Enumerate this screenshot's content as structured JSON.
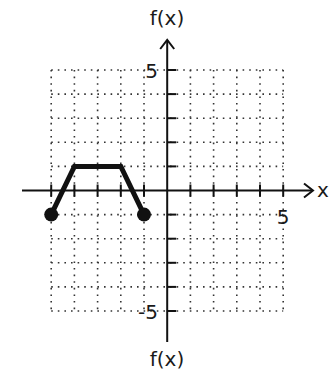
{
  "chart_data": {
    "type": "line",
    "title": "",
    "xlabel": "x",
    "ylabel": "f(x)",
    "ylabel_bottom": "f(x)",
    "xlim": [
      -5,
      5
    ],
    "ylim": [
      -5,
      5
    ],
    "grid": true,
    "grid_style": "dotted",
    "x_tick_labels": [
      {
        "value": 5,
        "label": "5"
      }
    ],
    "y_tick_labels": [
      {
        "value": 5,
        "label": "5"
      },
      {
        "value": -5,
        "label": "-5"
      }
    ],
    "series": [
      {
        "name": "f(x)",
        "x": [
          -5,
          -4,
          -2,
          -1
        ],
        "y": [
          -1,
          1,
          1,
          -1
        ],
        "endpoints": "closed"
      }
    ],
    "colors": {
      "line": "#111111",
      "grid": "#333333",
      "axis": "#111111"
    }
  },
  "labels": {
    "top_axis": "f(x)",
    "bottom_axis": "f(x)",
    "x_axis": "x",
    "tick_x5": "5",
    "tick_y5": "5",
    "tick_yneg5": "-5"
  }
}
